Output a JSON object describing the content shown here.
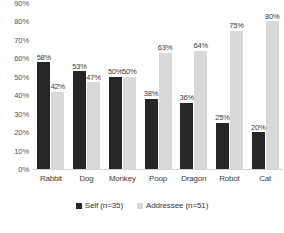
{
  "chart_data": {
    "type": "bar",
    "title": "",
    "subtitle": "",
    "xlabel": "",
    "ylabel": "",
    "categories": [
      "Rabbit",
      "Dog",
      "Monkey",
      "Poop",
      "Dragon",
      "Robot",
      "Cat"
    ],
    "series": [
      {
        "name": "Self (n=35)",
        "color": "#262626",
        "values": [
          58,
          53,
          50,
          38,
          36,
          25,
          20
        ],
        "value_labels": [
          "58%",
          "53%",
          "50%",
          "38%",
          "36%",
          "25%",
          "20%"
        ]
      },
      {
        "name": "Addressee (n=51)",
        "color": "#d9d9d9",
        "values": [
          42,
          47,
          50,
          63,
          64,
          75,
          80
        ],
        "value_labels": [
          "42%",
          "47%",
          "50%",
          "63%",
          "64%",
          "75%",
          "80%"
        ]
      }
    ],
    "ylim": [
      0,
      90
    ],
    "ytick_values": [
      90,
      80,
      70,
      60,
      50,
      40,
      30,
      20,
      10,
      0
    ],
    "ytick_labels": [
      "90%",
      "80%",
      "70%",
      "60%",
      "50%",
      "40%",
      "30%",
      "20%",
      "10%",
      "0%"
    ],
    "grid": false,
    "legend_position": "bottom"
  },
  "legend": {
    "items": [
      {
        "label": "Self (n=35)"
      },
      {
        "label": "Addressee (n=51)"
      }
    ]
  }
}
